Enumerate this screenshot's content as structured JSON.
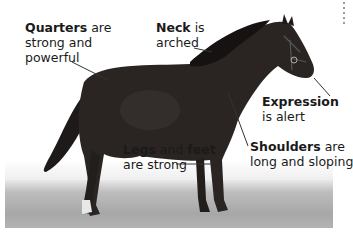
{
  "figure": {
    "annotations": [
      {
        "id": "quarters",
        "bold": "Quarters",
        "rest_line1": " are",
        "line2": "strong and",
        "line3": "powerful"
      },
      {
        "id": "neck",
        "bold": "Neck",
        "rest_line1": " is",
        "line2": "arched"
      },
      {
        "id": "expression",
        "bold": "Expression",
        "line2": "is alert"
      },
      {
        "id": "legs",
        "bold": "Legs",
        "mid": " and ",
        "bold2": "feet",
        "line2": "are strong"
      },
      {
        "id": "shoulders",
        "bold": "Shoulders",
        "rest_line1": " are",
        "line2": "long and sloping"
      }
    ],
    "colors": {
      "horse": "#2a2523",
      "leader_line": "#333333",
      "text": "#1a1a1a",
      "ground": "#aaaaaa"
    }
  }
}
